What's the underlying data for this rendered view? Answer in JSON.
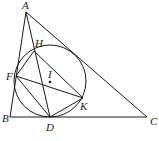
{
  "diagram": {
    "type": "geometry",
    "points": {
      "A": {
        "label": "A",
        "x": 26,
        "y": 12,
        "lx": 22,
        "ly": 9
      },
      "B": {
        "label": "B",
        "x": 10,
        "y": 117,
        "lx": 2,
        "ly": 122
      },
      "C": {
        "label": "C",
        "x": 147,
        "y": 117,
        "lx": 150,
        "ly": 125
      },
      "D": {
        "label": "D",
        "x": 50,
        "y": 117,
        "lx": 46,
        "ly": 131
      },
      "F": {
        "label": "F",
        "x": 16,
        "y": 76,
        "lx": 6,
        "ly": 80
      },
      "H": {
        "label": "H",
        "x": 34,
        "y": 51,
        "lx": 35,
        "ly": 47
      },
      "K": {
        "label": "K",
        "x": 83,
        "y": 98,
        "lx": 80,
        "ly": 110
      },
      "I": {
        "label": "I",
        "x": 50,
        "y": 82,
        "lx": 48,
        "ly": 78
      }
    },
    "circle": {
      "cx": 50,
      "cy": 81,
      "r": 36
    },
    "segments": [
      [
        "A",
        "B"
      ],
      [
        "B",
        "C"
      ],
      [
        "A",
        "C"
      ],
      [
        "A",
        "D"
      ],
      [
        "F",
        "K"
      ],
      [
        "F",
        "D"
      ],
      [
        "D",
        "K"
      ],
      [
        "H",
        "F"
      ],
      [
        "H",
        "K"
      ]
    ]
  }
}
